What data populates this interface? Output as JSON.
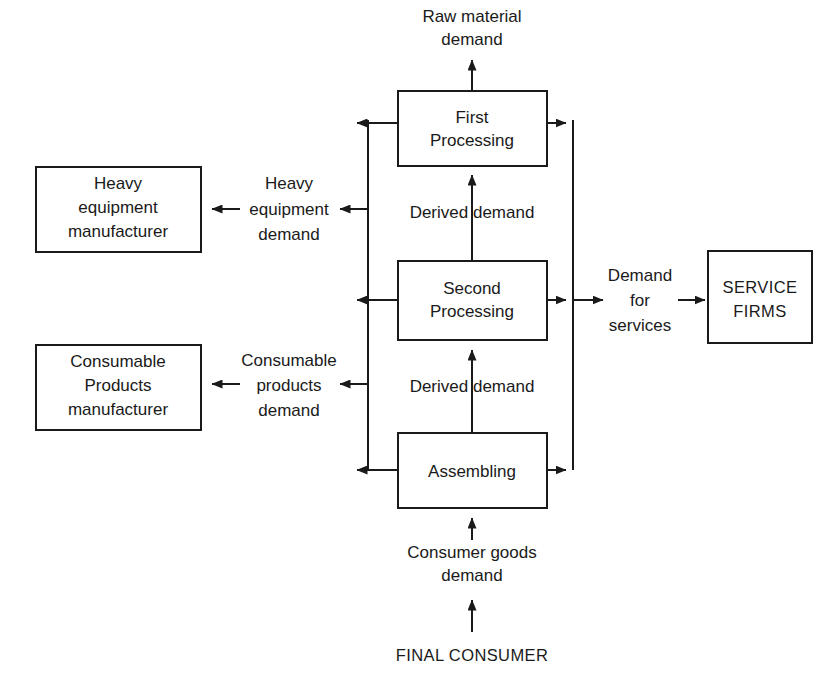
{
  "diagram": {
    "colors": {
      "background": "#ffffff",
      "stroke": "#1a1a1a",
      "box_fill": "#ffffff",
      "text": "#1a1a1a"
    },
    "nodes": {
      "first_processing": {
        "label_line1": "First",
        "label_line2": "Processing"
      },
      "second_processing": {
        "label_line1": "Second",
        "label_line2": "Processing"
      },
      "assembling": {
        "label_line1": "Assembling"
      },
      "heavy_equipment_manufacturer": {
        "label_line1": "Heavy",
        "label_line2": "equipment",
        "label_line3": "manufacturer"
      },
      "consumable_products_manufacturer": {
        "label_line1": "Consumable",
        "label_line2": "Products",
        "label_line3": "manufacturer"
      },
      "service_firms": {
        "label_line1": "SERVICE",
        "label_line2": "FIRMS"
      }
    },
    "edge_labels": {
      "raw_material_demand": {
        "line1": "Raw material",
        "line2": "demand"
      },
      "derived_demand_upper": {
        "line1": "Derived demand"
      },
      "derived_demand_lower": {
        "line1": "Derived demand"
      },
      "consumer_goods_demand": {
        "line1": "Consumer goods",
        "line2": "demand"
      },
      "heavy_equipment_demand": {
        "line1": "Heavy",
        "line2": "equipment",
        "line3": "demand"
      },
      "consumable_products_demand": {
        "line1": "Consumable",
        "line2": "products",
        "line3": "demand"
      },
      "demand_for_services": {
        "line1": "Demand",
        "line2": "for",
        "line3": "services"
      }
    },
    "terminal": {
      "final_consumer": "FINAL CONSUMER"
    }
  }
}
